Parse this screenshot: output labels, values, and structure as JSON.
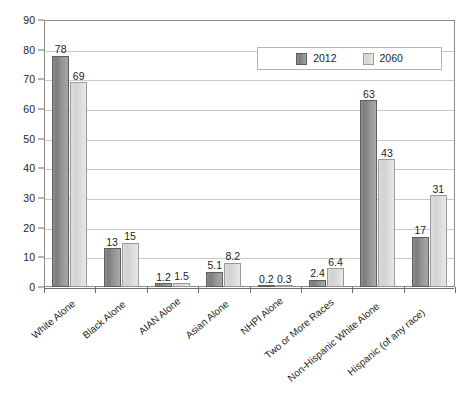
{
  "chart_data": {
    "type": "bar",
    "title": "",
    "subtitle": "",
    "xlabel": "",
    "ylabel": "",
    "ylim": [
      0,
      90
    ],
    "ytick_step": 10,
    "yticks": [
      "0",
      "10",
      "20",
      "30",
      "40",
      "50",
      "60",
      "70",
      "80",
      "90"
    ],
    "grid": true,
    "legend_position": "top-right",
    "categories": [
      "White Alone",
      "Black Alone",
      "AIAN Alone",
      "Asian Alone",
      "NHPI Alone",
      "Two or More Races",
      "Non-Hispanic White Alone",
      "Hispanic (of any race)"
    ],
    "series": [
      {
        "name": "2012",
        "color": "#8b8b8b",
        "values": [
          78,
          13,
          1.2,
          5.1,
          0.2,
          2.4,
          63,
          17
        ],
        "labels": [
          "78",
          "13",
          "1.2",
          "5.1",
          "0.2",
          "2.4",
          "63",
          "17"
        ]
      },
      {
        "name": "2060",
        "color": "#dcdcdc",
        "values": [
          69,
          15,
          1.5,
          8.2,
          0.3,
          6.4,
          43,
          31
        ],
        "labels": [
          "69",
          "15",
          "1.5",
          "8.2",
          "0.3",
          "6.4",
          "43",
          "31"
        ]
      }
    ]
  },
  "legend": {
    "items": [
      {
        "label": "2012",
        "swatch": "s2012"
      },
      {
        "label": "2060",
        "swatch": "s2060"
      }
    ]
  }
}
